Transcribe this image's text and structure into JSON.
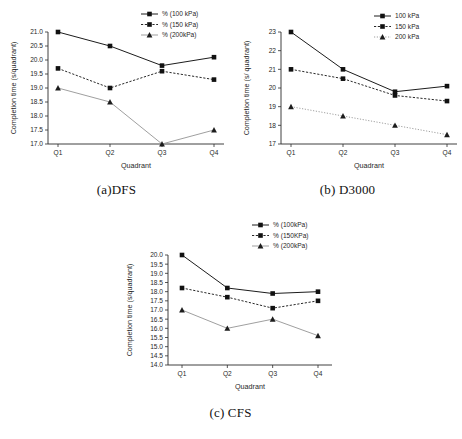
{
  "figure": {
    "background": "#ffffff",
    "panels": [
      {
        "id": "a",
        "caption": "(a)DFS",
        "chart_data": {
          "type": "line",
          "title": "",
          "xlabel": "Quadrant",
          "ylabel": "Completion time (s/quadrant)",
          "categories": [
            "Q1",
            "Q2",
            "Q3",
            "Q4"
          ],
          "ylim": [
            17.0,
            21.0
          ],
          "yticks": [
            "17.0",
            "17.5",
            "18.0",
            "18.5",
            "19.0",
            "19.5",
            "20.0",
            "20.5",
            "21.0"
          ],
          "ytick_values": [
            17.0,
            17.5,
            18.0,
            18.5,
            19.0,
            19.5,
            20.0,
            20.5,
            21.0
          ],
          "grid": false,
          "legend_position": "top-right",
          "series": [
            {
              "name": "% (100 kPa)",
              "values": [
                21.0,
                20.5,
                19.8,
                20.1
              ],
              "style": "solid",
              "marker": "square",
              "color": "#1c1c1c"
            },
            {
              "name": "% (150 kPa)",
              "values": [
                19.7,
                19.0,
                19.6,
                19.3
              ],
              "style": "dashed",
              "marker": "square",
              "color": "#1c1c1c"
            },
            {
              "name": "% (200kPa)",
              "values": [
                19.0,
                18.5,
                17.0,
                17.5
              ],
              "style": "solid",
              "marker": "triangle",
              "color": "#9a9a9a"
            }
          ]
        }
      },
      {
        "id": "b",
        "caption": "(b) D3000",
        "chart_data": {
          "type": "line",
          "title": "",
          "xlabel": "Quadrant",
          "ylabel": "Completion time (s/ quadrant)",
          "categories": [
            "Q1",
            "Q2",
            "Q3",
            "Q4"
          ],
          "ylim": [
            17,
            23
          ],
          "yticks": [
            "17",
            "18",
            "19",
            "20",
            "21",
            "22",
            "23"
          ],
          "ytick_values": [
            17,
            18,
            19,
            20,
            21,
            22,
            23
          ],
          "grid": false,
          "legend_position": "top-right",
          "series": [
            {
              "name": "100 kPa",
              "values": [
                23.0,
                21.0,
                19.8,
                20.1
              ],
              "style": "solid",
              "marker": "square",
              "color": "#1c1c1c"
            },
            {
              "name": "150 kPa",
              "values": [
                21.0,
                20.5,
                19.6,
                19.3
              ],
              "style": "dashed",
              "marker": "square",
              "color": "#1c1c1c"
            },
            {
              "name": "200 kPa",
              "values": [
                19.0,
                18.5,
                18.0,
                17.5
              ],
              "style": "dotted",
              "marker": "triangle",
              "color": "#9a9a9a"
            }
          ]
        }
      },
      {
        "id": "c",
        "caption": "(c) CFS",
        "chart_data": {
          "type": "line",
          "title": "",
          "xlabel": "Quadrant",
          "ylabel": "Completion time (s/quadrant)",
          "categories": [
            "Q1",
            "Q2",
            "Q3",
            "Q4"
          ],
          "ylim": [
            14.0,
            20.0
          ],
          "yticks": [
            "14.0",
            "14.5",
            "15.0",
            "15.5",
            "16.0",
            "16.5",
            "17.0",
            "17.5",
            "18.0",
            "18.5",
            "19.0",
            "19.5",
            "20.0"
          ],
          "ytick_values": [
            14.0,
            14.5,
            15.0,
            15.5,
            16.0,
            16.5,
            17.0,
            17.5,
            18.0,
            18.5,
            19.0,
            19.5,
            20.0
          ],
          "grid": false,
          "legend_position": "top-right",
          "series": [
            {
              "name": "% (100kPa)",
              "values": [
                20.0,
                18.2,
                17.9,
                18.0
              ],
              "style": "solid",
              "marker": "square",
              "color": "#1c1c1c"
            },
            {
              "name": "% (150KPa)",
              "values": [
                18.2,
                17.7,
                17.1,
                17.5
              ],
              "style": "dashed",
              "marker": "square",
              "color": "#1c1c1c"
            },
            {
              "name": "% (200kPa)",
              "values": [
                17.0,
                16.0,
                16.5,
                15.6
              ],
              "style": "solid",
              "marker": "triangle",
              "color": "#9a9a9a"
            }
          ]
        }
      }
    ]
  }
}
